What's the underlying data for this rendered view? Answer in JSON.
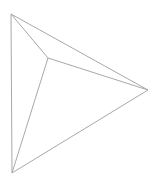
{
  "diagram": {
    "type": "wireframe-pyramid-top-view",
    "stroke_color": "#a8a8a8",
    "stroke_width": 1,
    "background": "#ffffff",
    "vertices": {
      "top": [
        11,
        14
      ],
      "right": [
        148,
        90
      ],
      "bottom": [
        12,
        173
      ],
      "apex": [
        48,
        58
      ]
    },
    "edges": [
      [
        "top",
        "right"
      ],
      [
        "right",
        "bottom"
      ],
      [
        "bottom",
        "top"
      ],
      [
        "apex",
        "top"
      ],
      [
        "apex",
        "right"
      ],
      [
        "apex",
        "bottom"
      ]
    ]
  }
}
